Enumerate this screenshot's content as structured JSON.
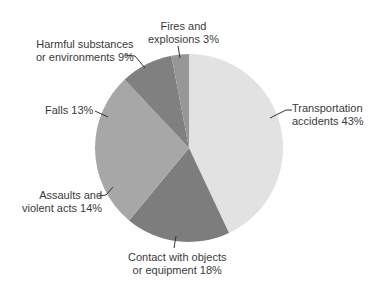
{
  "chart_data": {
    "type": "pie",
    "title": "",
    "start_angle_deg": 0,
    "direction": "clockwise",
    "slices": [
      {
        "label": "Transportation accidents",
        "value": 43,
        "color": "#e2e2e2"
      },
      {
        "label": "Contact with objects or equipment",
        "value": 18,
        "color": "#7d7d7d"
      },
      {
        "label": "Assaults and violent acts",
        "value": 14,
        "color": "#a7a7a7"
      },
      {
        "label": "Falls",
        "value": 13,
        "color": "#a7a7a7"
      },
      {
        "label": "Harmful substances or environments",
        "value": 9,
        "color": "#808080"
      },
      {
        "label": "Fires and explosions",
        "value": 3,
        "color": "#979797"
      }
    ],
    "center": [
      189,
      148
    ],
    "radius": 94
  },
  "labels": {
    "transportation": {
      "line1": "Transportation",
      "line2": "accidents 43%"
    },
    "contact": {
      "line1": "Contact with objects",
      "line2": "or equipment 18%"
    },
    "assaults": {
      "line1": "Assaults and",
      "line2": "violent acts 14%"
    },
    "falls": {
      "line1": "Falls 13%"
    },
    "harmful": {
      "line1": "Harmful substances",
      "line2": "or environments 9%"
    },
    "fires": {
      "line1": "Fires and",
      "line2": "explosions 3%"
    }
  }
}
